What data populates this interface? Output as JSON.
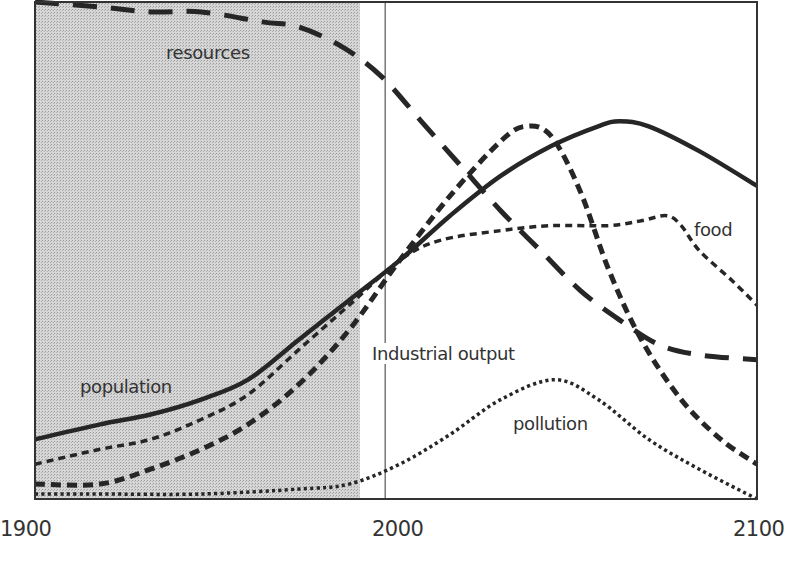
{
  "chart_data": {
    "type": "line",
    "title": "",
    "xlabel": "",
    "ylabel": "",
    "xlim": [
      1900,
      2100
    ],
    "ylim": [
      0,
      1
    ],
    "grid": false,
    "legend": "inline labels",
    "x_ticks": [
      "1900",
      "2000",
      "2100"
    ],
    "shaded_region": {
      "from": 1900,
      "to": 1990,
      "pattern": "stipple-gray"
    },
    "reference_line": {
      "x": 1997
    },
    "series": [
      {
        "name": "population",
        "style": "solid",
        "label_pos": {
          "left": 80,
          "top": 376
        },
        "points": [
          [
            1900,
            0.12
          ],
          [
            1918,
            0.15
          ],
          [
            1932,
            0.17
          ],
          [
            1946,
            0.2
          ],
          [
            1959,
            0.24
          ],
          [
            1973,
            0.32
          ],
          [
            1987,
            0.4
          ],
          [
            2001,
            0.48
          ],
          [
            2015,
            0.57
          ],
          [
            2029,
            0.65
          ],
          [
            2043,
            0.71
          ],
          [
            2056,
            0.75
          ],
          [
            2062,
            0.76
          ],
          [
            2070,
            0.75
          ],
          [
            2084,
            0.7
          ],
          [
            2100,
            0.63
          ]
        ]
      },
      {
        "name": "Industrial output",
        "style": "dash-bold",
        "label_pos": {
          "left": 370,
          "top": 343
        },
        "boxed": true,
        "points": [
          [
            1900,
            0.03
          ],
          [
            1918,
            0.03
          ],
          [
            1932,
            0.06
          ],
          [
            1946,
            0.1
          ],
          [
            1959,
            0.15
          ],
          [
            1973,
            0.23
          ],
          [
            1987,
            0.34
          ],
          [
            2001,
            0.48
          ],
          [
            2015,
            0.61
          ],
          [
            2029,
            0.72
          ],
          [
            2036,
            0.75
          ],
          [
            2043,
            0.73
          ],
          [
            2051,
            0.62
          ],
          [
            2059,
            0.46
          ],
          [
            2068,
            0.32
          ],
          [
            2079,
            0.2
          ],
          [
            2090,
            0.12
          ],
          [
            2100,
            0.07
          ]
        ]
      },
      {
        "name": "food",
        "style": "dash-fine",
        "label_pos": {
          "left": 694,
          "top": 219
        },
        "points": [
          [
            1900,
            0.07
          ],
          [
            1918,
            0.1
          ],
          [
            1932,
            0.12
          ],
          [
            1946,
            0.16
          ],
          [
            1959,
            0.21
          ],
          [
            1973,
            0.3
          ],
          [
            1987,
            0.39
          ],
          [
            2001,
            0.48
          ],
          [
            2012,
            0.52
          ],
          [
            2029,
            0.54
          ],
          [
            2043,
            0.55
          ],
          [
            2059,
            0.55
          ],
          [
            2068,
            0.56
          ],
          [
            2075,
            0.57
          ],
          [
            2079,
            0.55
          ],
          [
            2084,
            0.5
          ],
          [
            2093,
            0.44
          ],
          [
            2100,
            0.39
          ]
        ]
      },
      {
        "name": "pollution",
        "style": "dotted",
        "label_pos": {
          "left": 513,
          "top": 413
        },
        "points": [
          [
            1900,
            0.01
          ],
          [
            1918,
            0.01
          ],
          [
            1946,
            0.01
          ],
          [
            1973,
            0.02
          ],
          [
            1987,
            0.03
          ],
          [
            2001,
            0.07
          ],
          [
            2015,
            0.13
          ],
          [
            2029,
            0.2
          ],
          [
            2044,
            0.24
          ],
          [
            2056,
            0.2
          ],
          [
            2070,
            0.12
          ],
          [
            2084,
            0.06
          ],
          [
            2100,
            0.0
          ]
        ]
      },
      {
        "name": "resources",
        "style": "dash-long",
        "label_pos": {
          "left": 166,
          "top": 42
        },
        "points": [
          [
            1900,
            1.0
          ],
          [
            1918,
            0.99
          ],
          [
            1932,
            0.98
          ],
          [
            1946,
            0.98
          ],
          [
            1963,
            0.96
          ],
          [
            1973,
            0.95
          ],
          [
            1985,
            0.91
          ],
          [
            1996,
            0.85
          ],
          [
            2007,
            0.76
          ],
          [
            2018,
            0.67
          ],
          [
            2029,
            0.58
          ],
          [
            2040,
            0.5
          ],
          [
            2051,
            0.42
          ],
          [
            2062,
            0.36
          ],
          [
            2073,
            0.31
          ],
          [
            2084,
            0.29
          ],
          [
            2100,
            0.28
          ]
        ]
      }
    ]
  }
}
